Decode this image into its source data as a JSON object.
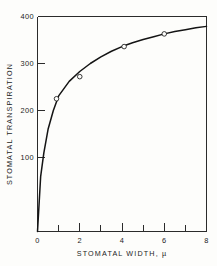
{
  "figure": {
    "background_color": "#fdfdfb",
    "line_color": "#141414",
    "axis_color": "#2b2b2b"
  },
  "chart_data": {
    "type": "scatter",
    "title": "",
    "subtitle": "",
    "xlabel": "STOMATAL  WIDTH, µ",
    "ylabel": "STOMATAL  TRANSPIRATION",
    "xlim": [
      0,
      8
    ],
    "ylim": [
      0,
      400
    ],
    "grid": false,
    "legend": null,
    "x_ticks_major": [
      0,
      2,
      4,
      6,
      8
    ],
    "x_ticks_minor": [
      1,
      3,
      5,
      7
    ],
    "x_tick_labels": [
      "0",
      "2",
      "4",
      "6",
      "8"
    ],
    "y_ticks_major": [
      100,
      200,
      300,
      400
    ],
    "y_tick_labels": [
      "100",
      "200",
      "300",
      "400"
    ],
    "series": [
      {
        "name": "observed points",
        "marker": "open-circle",
        "x": [
          0.9,
          2.0,
          4.1,
          6.0
        ],
        "y": [
          225,
          272,
          336,
          363
        ]
      },
      {
        "name": "fitted curve",
        "marker": "none",
        "x": [
          0.0,
          0.15,
          0.3,
          0.5,
          0.75,
          1.0,
          1.5,
          2.0,
          2.5,
          3.0,
          3.5,
          4.0,
          4.5,
          5.0,
          5.5,
          6.0,
          6.5,
          7.0,
          7.5,
          8.0
        ],
        "y": [
          0,
          60,
          110,
          160,
          200,
          231,
          262,
          283,
          300,
          314,
          326,
          336,
          344,
          351,
          357,
          363,
          368,
          372,
          376,
          379
        ]
      }
    ]
  },
  "axis_labels": {
    "x_title": "STOMATAL  WIDTH, µ",
    "y_title": "STOMATAL  TRANSPIRATION"
  }
}
